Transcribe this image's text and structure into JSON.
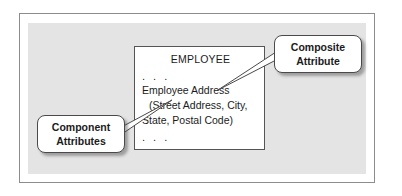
{
  "figure": {
    "entity": {
      "title": "EMPLOYEE",
      "dots_top": ". . .",
      "attribute": "Employee Address",
      "components_line1": "(Street Address, City,",
      "components_line2": "State, Postal Code)",
      "dots_bottom": ". . ."
    },
    "callouts": {
      "composite": {
        "line1": "Composite",
        "line2": "Attribute"
      },
      "component": {
        "line1": "Component",
        "line2": "Attributes"
      }
    },
    "colors": {
      "panel_background": "#e4e4e4",
      "frame_border": "#8d8d8d",
      "entity_border": "#555555",
      "entity_fill": "#ffffff",
      "callout_border": "#4a4a4a",
      "text": "#1b1b1b"
    }
  }
}
